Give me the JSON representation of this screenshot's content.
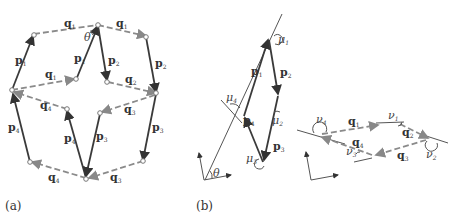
{
  "panels": {
    "a": {
      "caption": "(a)",
      "p_labels": [
        "p",
        "p",
        "p",
        "p",
        "p",
        "p",
        "p",
        "p"
      ],
      "p_subs": [
        "1",
        "1",
        "2",
        "2",
        "4",
        "4",
        "3",
        "3"
      ],
      "q_labels": [
        "q",
        "q",
        "q",
        "q",
        "q",
        "q",
        "q",
        "q"
      ],
      "q_subs": [
        "1",
        "1",
        "1",
        "2",
        "4",
        "4",
        "3",
        "3"
      ],
      "angle": "θ"
    },
    "b": {
      "caption": "(b)",
      "p_labels": [
        "p",
        "p",
        "p",
        "p"
      ],
      "p_subs": [
        "1",
        "2",
        "3",
        "4"
      ],
      "mu_labels": [
        "μ",
        "μ",
        "μ",
        "μ"
      ],
      "mu_subs": [
        "1",
        "2",
        "3",
        "4"
      ],
      "angle": "θ"
    },
    "c": {
      "q_labels": [
        "q",
        "q",
        "q",
        "q"
      ],
      "q_subs": [
        "1",
        "2",
        "3",
        "4"
      ],
      "nu_labels": [
        "ν",
        "ν",
        "ν",
        "ν"
      ],
      "nu_subs": [
        "1",
        "2",
        "3",
        "4"
      ]
    }
  },
  "colors": {
    "solid": "#3a3a3a",
    "dashed": "#8a8a8a"
  }
}
